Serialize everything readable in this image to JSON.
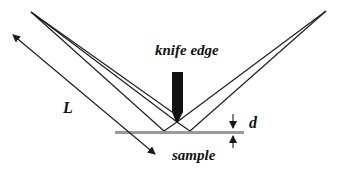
{
  "diagram": {
    "labels": {
      "knife_edge": "knife edge",
      "length": "L",
      "gap": "d",
      "sample": "sample"
    },
    "colors": {
      "line": "#1a1a1a",
      "knife": "#111111",
      "sample": "#9a9a9a",
      "background": "#ffffff"
    },
    "components": [
      "source point (left)",
      "knife edge",
      "sample surface",
      "detector point (right)"
    ]
  }
}
